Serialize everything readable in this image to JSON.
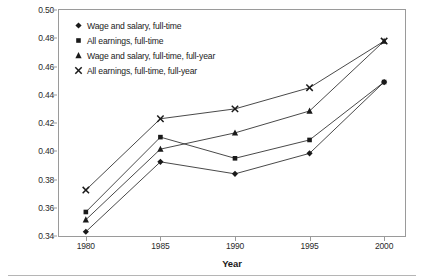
{
  "chart_data": {
    "type": "line",
    "title": "",
    "xlabel": "Year",
    "ylabel": "BA-high school wage gap",
    "x": [
      1980,
      1985,
      1990,
      1995,
      2000
    ],
    "xtick_labels": [
      "1980",
      "1985",
      "1990",
      "1995",
      "2000"
    ],
    "xlim": [
      1978.2,
      2001.4
    ],
    "ylim": [
      0.34,
      0.5
    ],
    "ytick_labels": [
      "0.34",
      "0.36",
      "0.38",
      "0.40",
      "0.42",
      "0.44",
      "0.46",
      "0.48",
      "0.50"
    ],
    "yticks": [
      0.34,
      0.36,
      0.38,
      0.4,
      0.42,
      0.44,
      0.46,
      0.48,
      0.5
    ],
    "grid": false,
    "legend_position": "upper left",
    "line_color": "#1a1a1a",
    "series": [
      {
        "name": "Wage and salary, full-time",
        "marker": "diamond",
        "values": [
          0.343,
          0.3925,
          0.384,
          0.3985,
          0.449
        ]
      },
      {
        "name": "All earnings, full-time",
        "marker": "square",
        "values": [
          0.357,
          0.41,
          0.395,
          0.408,
          0.449
        ]
      },
      {
        "name": "Wage and salary, full-time, full-year",
        "marker": "triangle",
        "values": [
          0.3515,
          0.4015,
          0.413,
          0.4285,
          0.478
        ]
      },
      {
        "name": "All earnings, full-time, full-year",
        "marker": "cross",
        "values": [
          0.3725,
          0.423,
          0.43,
          0.445,
          0.478
        ]
      }
    ]
  }
}
